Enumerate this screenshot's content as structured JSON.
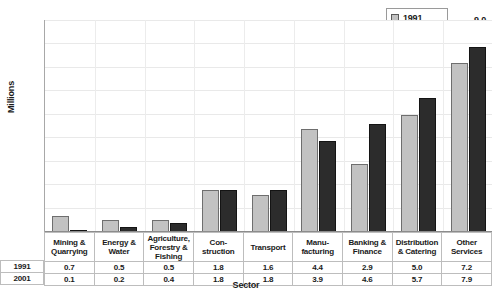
{
  "chart_data": {
    "type": "bar",
    "title": "",
    "xlabel": "Sector",
    "ylabel": "Millions",
    "ylim": [
      0,
      9
    ],
    "yticks": [
      "0.0",
      "1.0",
      "2.0",
      "3.0",
      "4.0",
      "5.0",
      "6.0",
      "7.0",
      "8.0",
      "9.0"
    ],
    "ytick_values": [
      0,
      1,
      2,
      3,
      4,
      5,
      6,
      7,
      8,
      9
    ],
    "grid": true,
    "legend_position": "top-right",
    "categories": [
      "Mining & Quarrying",
      "Energy & Water",
      "Agriculture, Forestry & Fishing",
      "Con-struction",
      "Transport",
      "Manu-facturing",
      "Banking & Finance",
      "Distribution & Catering",
      "Other Services"
    ],
    "category_lines": [
      [
        "Mining &",
        "Quarrying"
      ],
      [
        "Energy &",
        "Water"
      ],
      [
        "Agriculture,",
        "Forestry &",
        "Fishing"
      ],
      [
        "Con-",
        "struction"
      ],
      [
        "Transport"
      ],
      [
        "Manu-",
        "facturing"
      ],
      [
        "Banking &",
        "Finance"
      ],
      [
        "Distribution",
        "& Catering"
      ],
      [
        "Other",
        "Services"
      ]
    ],
    "series": [
      {
        "name": "1991",
        "color": "#c2c2c2",
        "values": [
          0.7,
          0.5,
          0.5,
          1.8,
          1.6,
          4.4,
          2.9,
          5.0,
          7.2
        ],
        "labels": [
          "0.7",
          "0.5",
          "0.5",
          "1.8",
          "1.6",
          "4.4",
          "2.9",
          "5.0",
          "7.2"
        ]
      },
      {
        "name": "2001",
        "color": "#2c2c2c",
        "values": [
          0.1,
          0.2,
          0.4,
          1.8,
          1.8,
          3.9,
          4.6,
          5.7,
          7.9
        ],
        "labels": [
          "0.1",
          "0.2",
          "0.4",
          "1.8",
          "1.8",
          "3.9",
          "4.6",
          "5.7",
          "7.9"
        ]
      }
    ]
  },
  "legend": {
    "items": [
      {
        "label": "1991",
        "color": "#c2c2c2"
      },
      {
        "label": "2001",
        "color": "#2c2c2c"
      }
    ]
  },
  "table": {
    "row_labels": [
      "1991",
      "2001"
    ]
  }
}
